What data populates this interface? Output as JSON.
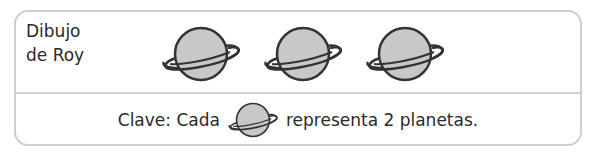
{
  "row": {
    "label_line1": "Dibujo",
    "label_line2": "de Roy",
    "icon": "planet-with-ring-icon",
    "icon_count": 3
  },
  "key": {
    "prefix": "Clave: Cada",
    "icon": "planet-with-ring-icon",
    "suffix": "representa 2 planetas."
  },
  "colors": {
    "planet_fill": "#c8c8c8",
    "outline": "#333333",
    "border": "#cfcfcf"
  }
}
